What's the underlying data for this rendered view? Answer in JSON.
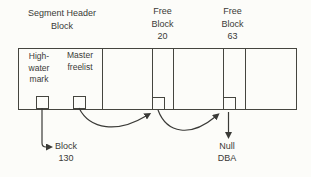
{
  "colors": {
    "ink": "#3a3a37",
    "line": "#45453f",
    "background": "#fcfcf9"
  },
  "labels": {
    "segment_header_block": "Segment Header\nBlock",
    "free_block_20": "Free\nBlock\n20",
    "free_block_63": "Free\nBlock\n63",
    "high_water_mark": "High-\nwater\nmark",
    "master_freelist": "Master\nfreelist",
    "block_130": "Block\n130",
    "null_dba": "Null\nDBA"
  },
  "arrows": [
    {
      "from": "high-water-mark-slot",
      "to": "block-130-label"
    },
    {
      "from": "master-freelist-slot",
      "to": "free-block-20-slot"
    },
    {
      "from": "free-block-20-slot",
      "to": "free-block-63-slot"
    },
    {
      "from": "free-block-63-slot",
      "to": "null-dba-label"
    }
  ]
}
